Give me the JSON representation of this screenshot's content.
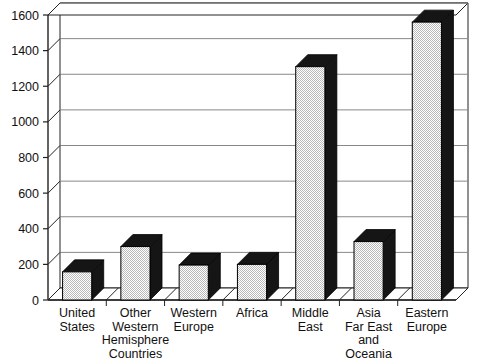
{
  "chart_data": {
    "type": "bar",
    "title": "",
    "subtitle": "",
    "xlabel": "",
    "ylabel": "",
    "categories": [
      "United States",
      "Other Western Hemisphere Countries",
      "Western Europe",
      "Africa",
      "Middle East",
      "Asia Far East and Oceania",
      "Eastern Europe"
    ],
    "category_lines": [
      [
        "United",
        "States"
      ],
      [
        "Other",
        "Western",
        "Hemisphere",
        "Countries"
      ],
      [
        "Western",
        "Europe"
      ],
      [
        "Africa"
      ],
      [
        "Middle",
        "East"
      ],
      [
        "Asia",
        "Far East",
        "and",
        "Oceania"
      ],
      [
        "Eastern",
        "Europe"
      ]
    ],
    "values": [
      158,
      300,
      196,
      200,
      1310,
      328,
      1560
    ],
    "ylim": [
      0,
      1600
    ],
    "ytick_step": 200,
    "yticks": [
      0,
      200,
      400,
      600,
      800,
      1000,
      1200,
      1400,
      1600
    ],
    "ytick_labels": [
      "0",
      "200",
      "400",
      "600",
      "800",
      "1000",
      "1200",
      "1400",
      "1600"
    ],
    "grid": "horizontal",
    "legend": "none",
    "style": "3d-bar",
    "colors": {
      "bar_face": "#e9e9e9",
      "bar_side": "#151515",
      "bar_top": "#151515",
      "axis": "#222222",
      "gridline": "#888888",
      "background": "#ffffff",
      "text": "#111111"
    }
  }
}
